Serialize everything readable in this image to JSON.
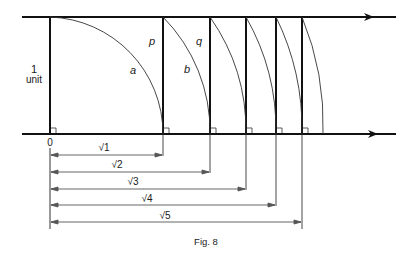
{
  "figure": {
    "caption": "Fig. 8",
    "unit_label_number": "1",
    "unit_label_text": "unit",
    "origin_label": "0",
    "line_labels": {
      "p": "p",
      "q": "q"
    },
    "arc_labels": {
      "a": "a",
      "b": "b"
    },
    "dimension_labels": [
      "√1",
      "√2",
      "√3",
      "√4",
      "√5"
    ]
  },
  "geometry": {
    "origin_x": 50,
    "unit_px": 113,
    "top_y": 17,
    "bottom_y": 134,
    "vertical_positions": [
      "√1",
      "√2",
      "√3",
      "√4",
      "√5"
    ],
    "arc_radii": [
      "1",
      "√2",
      "√3",
      "√4",
      "√5",
      "√6"
    ]
  }
}
